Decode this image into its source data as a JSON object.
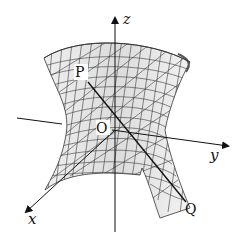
{
  "figure": {
    "axes": {
      "x_label": "x",
      "y_label": "y",
      "z_label": "z"
    },
    "points": {
      "origin": "O",
      "p": "P",
      "q": "Q"
    },
    "colors": {
      "surface_fill": "#e4e4e4",
      "surface_dark": "#c9c9c9",
      "grid_line": "#3a3a3a",
      "axis": "#111111"
    }
  }
}
